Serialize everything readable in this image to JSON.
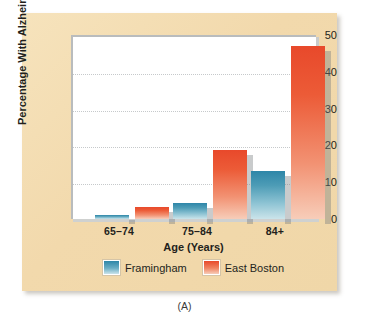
{
  "figure": {
    "caption": "(A)",
    "panel_color": "#f2d9ac",
    "plot_background": "#ffffff"
  },
  "chart_data": {
    "type": "bar",
    "title": "",
    "xlabel": "Age (Years)",
    "ylabel": "Percentage With Alzheimer's Disease",
    "categories": [
      "65–74",
      "75–84",
      "84+"
    ],
    "series": [
      {
        "name": "Framingham",
        "color": "#2e86a8",
        "values": [
          1,
          4.3,
          13
        ]
      },
      {
        "name": "East Boston",
        "color": "#e8492b",
        "values": [
          3.4,
          18.7,
          47
        ]
      }
    ],
    "ylim": [
      0,
      50
    ],
    "yticks": [
      0,
      10,
      20,
      30,
      40,
      50
    ],
    "ytick_labels": [
      "0",
      "10",
      "20",
      "30",
      "40",
      "50"
    ],
    "grid": true,
    "grid_style": "dotted-horizontal",
    "legend_position": "bottom-center"
  }
}
